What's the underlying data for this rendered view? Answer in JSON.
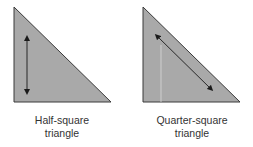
{
  "diagrams": [
    {
      "name": "half-square-triangle",
      "caption_line1": "Half-square",
      "caption_line2": "triangle",
      "grain_arrow": "vertical, along straight leg"
    },
    {
      "name": "quarter-square-triangle",
      "caption_line1": "Quarter-square",
      "caption_line2": "triangle",
      "grain_arrow": "diagonal, along long edge"
    }
  ],
  "colors": {
    "fill": "#a9a9a9",
    "edge": "#3a3a3a",
    "arrow": "#1a1a1a",
    "seam": "#d8d8d8"
  }
}
